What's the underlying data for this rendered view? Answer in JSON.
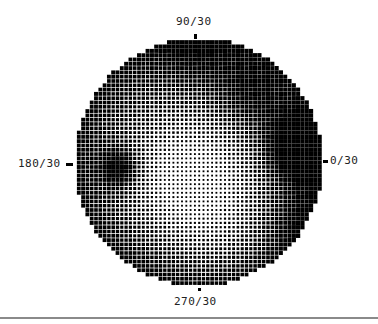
{
  "chart_data": {
    "type": "heatmap",
    "title": "",
    "subtitle": "",
    "axis_labels": {
      "top": "90/30",
      "left": "180/30",
      "right": "0/30",
      "bottom": "270/30"
    },
    "field": {
      "center_x": 198.5,
      "center_y": 162,
      "radius": 124,
      "dot_pitch": 4.3
    },
    "grayscale_model": {
      "base_darkness": 0.5,
      "edge_darkening": 0.35,
      "regions": [
        {
          "name": "blind-spot",
          "x": 120,
          "y": 168,
          "sigma": 14,
          "darkness": 0.55
        },
        {
          "name": "right-scotoma",
          "x": 300,
          "y": 148,
          "sigma": 24,
          "darkness": 0.7
        },
        {
          "name": "superior-arcuate-band",
          "x": 250,
          "y": 95,
          "sigma": 26,
          "darkness": 0.3
        },
        {
          "name": "superior-periphery",
          "x": 195,
          "y": 50,
          "sigma": 30,
          "darkness": 0.25
        },
        {
          "name": "central-bright-area",
          "x": 190,
          "y": 178,
          "sigma": 40,
          "darkness": -0.45
        },
        {
          "name": "inferior-light-area",
          "x": 220,
          "y": 235,
          "sigma": 35,
          "darkness": -0.15
        },
        {
          "name": "inferior-right-dark",
          "x": 300,
          "y": 220,
          "sigma": 25,
          "darkness": 0.2
        }
      ]
    },
    "legend": [],
    "grid": false
  },
  "footer": {
    "rule_visible": true
  }
}
